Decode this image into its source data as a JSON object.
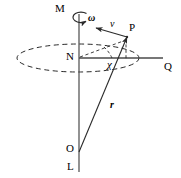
{
  "figure": {
    "type": "physics-diagram",
    "background_color": "#ffffff",
    "stroke_color": "#2a2a2a",
    "labels": [
      {
        "id": "axis-top",
        "text": "M",
        "style": "roman",
        "x": 55,
        "y": 3
      },
      {
        "id": "omega",
        "text": "ω",
        "style": "greek",
        "x": 88,
        "y": 13
      },
      {
        "id": "velocity",
        "text": "v",
        "style": "italic",
        "x": 110,
        "y": 19
      },
      {
        "id": "point-p",
        "text": "P",
        "style": "roman",
        "x": 129,
        "y": 22
      },
      {
        "id": "node-n",
        "text": "N",
        "style": "roman",
        "x": 66,
        "y": 51
      },
      {
        "id": "axis-right",
        "text": "Q",
        "style": "roman",
        "x": 164,
        "y": 61
      },
      {
        "id": "angle-chi",
        "text": "χ",
        "style": "chi",
        "x": 107,
        "y": 59
      },
      {
        "id": "radius-r",
        "text": "r",
        "style": "bolditalic",
        "x": 110,
        "y": 100
      },
      {
        "id": "origin-o",
        "text": "O",
        "style": "roman",
        "x": 66,
        "y": 143
      },
      {
        "id": "axis-bottom",
        "text": "L",
        "style": "roman",
        "x": 67,
        "y": 161
      }
    ],
    "geometry": {
      "rotation_axis": {
        "x": 79,
        "y_top": 14,
        "y_bottom": 172
      },
      "horizontal_axis": {
        "y": 58,
        "x_start": 79,
        "x_end": 163
      },
      "orbit_ellipse": {
        "cx": 78,
        "cy": 58,
        "rx": 61,
        "ry": 14,
        "dashed": true
      },
      "point_p": {
        "x": 127,
        "y": 37
      },
      "origin_o": {
        "x": 79,
        "y": 152
      },
      "velocity_arrow": {
        "x1": 127,
        "y1": 37,
        "x2": 96,
        "y2": 28
      },
      "radius_vector": {
        "x1": 79,
        "y1": 152,
        "x2": 127,
        "y2": 37
      },
      "spin_arrow": {
        "cx": 79,
        "cy": 17,
        "rx": 8,
        "ry": 5
      }
    }
  }
}
